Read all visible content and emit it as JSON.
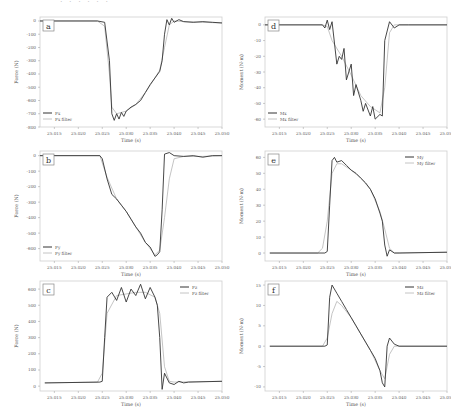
{
  "chart_data": [
    {
      "id": "a",
      "type": "line",
      "label": "a",
      "xlabel": "Time (s)",
      "ylabel": "Force (N)",
      "xticks": [
        "25.015",
        "25.020",
        "25.025",
        "25.030",
        "25.035",
        "25.040",
        "25.045",
        "25.050"
      ],
      "xlim": [
        25.012,
        25.05
      ],
      "yticks": [
        0,
        -100,
        -200,
        -300,
        -400,
        -500,
        -600,
        -700,
        -800
      ],
      "ylim": [
        -800,
        30
      ],
      "legend_pos": "lower-left",
      "series": [
        {
          "name": "Fx",
          "x": [
            25.012,
            25.024,
            25.0255,
            25.0265,
            25.027,
            25.0275,
            25.028,
            25.0285,
            25.029,
            25.0295,
            25.03,
            25.031,
            25.032,
            25.033,
            25.034,
            25.035,
            25.036,
            25.037,
            25.0375,
            25.038,
            25.0385,
            25.039,
            25.0395,
            25.04,
            25.041,
            25.042,
            25.044,
            25.046,
            25.048,
            25.05
          ],
          "values": [
            0,
            0,
            -10,
            -300,
            -700,
            -750,
            -700,
            -740,
            -690,
            -720,
            -680,
            -650,
            -630,
            -600,
            -540,
            -480,
            -430,
            -380,
            -300,
            -100,
            10,
            -30,
            20,
            -10,
            10,
            -5,
            -10,
            -5,
            -10,
            -15
          ]
        },
        {
          "name": "Fx filter",
          "x": [
            25.012,
            25.024,
            25.0255,
            25.0265,
            25.027,
            25.028,
            25.03,
            25.032,
            25.034,
            25.036,
            25.037,
            25.038,
            25.039,
            25.04,
            25.042,
            25.046,
            25.05
          ],
          "values": [
            0,
            0,
            -40,
            -400,
            -650,
            -700,
            -680,
            -630,
            -540,
            -430,
            -370,
            -200,
            -30,
            0,
            -5,
            -10,
            -15
          ]
        }
      ]
    },
    {
      "id": "b",
      "type": "line",
      "label": "b",
      "xlabel": "Time (s)",
      "ylabel": "Force (N)",
      "xticks": [
        "25.015",
        "25.020",
        "25.025",
        "25.030",
        "25.035",
        "25.040",
        "25.045",
        "25.050"
      ],
      "xlim": [
        25.012,
        25.05
      ],
      "yticks": [
        0,
        -100,
        -200,
        -300,
        -400,
        -500,
        -600
      ],
      "ylim": [
        -680,
        30
      ],
      "legend_pos": "lower-left",
      "series": [
        {
          "name": "Fy",
          "x": [
            25.012,
            25.0245,
            25.025,
            25.026,
            25.027,
            25.028,
            25.029,
            25.03,
            25.031,
            25.032,
            25.033,
            25.034,
            25.035,
            25.036,
            25.0365,
            25.037,
            25.0375,
            25.038,
            25.039,
            25.04,
            25.042,
            25.044,
            25.046,
            25.048,
            25.05
          ],
          "values": [
            0,
            0,
            -20,
            -150,
            -250,
            -280,
            -320,
            -360,
            -410,
            -460,
            -500,
            -560,
            -590,
            -650,
            -640,
            -620,
            -350,
            10,
            20,
            0,
            -5,
            0,
            -10,
            0,
            0
          ]
        },
        {
          "name": "Fy filter",
          "x": [
            25.012,
            25.0245,
            25.026,
            25.028,
            25.03,
            25.032,
            25.034,
            25.036,
            25.037,
            25.038,
            25.039,
            25.04,
            25.042,
            25.046,
            25.05
          ],
          "values": [
            0,
            0,
            -140,
            -280,
            -360,
            -460,
            -560,
            -640,
            -610,
            -400,
            -150,
            -20,
            -5,
            -5,
            0
          ]
        }
      ]
    },
    {
      "id": "c",
      "type": "line",
      "label": "c",
      "xlabel": "Time (s)",
      "ylabel": "Force (N)",
      "xticks": [
        "25.015",
        "25.020",
        "25.025",
        "25.030",
        "25.035",
        "25.040",
        "25.045",
        "25.050"
      ],
      "xlim": [
        25.012,
        25.05
      ],
      "yticks": [
        0,
        100,
        200,
        300,
        400,
        500,
        600
      ],
      "ylim": [
        -30,
        650
      ],
      "legend_pos": "upper-right",
      "series": [
        {
          "name": "Fz",
          "x": [
            25.013,
            25.0245,
            25.025,
            25.0255,
            25.026,
            25.027,
            25.028,
            25.029,
            25.03,
            25.031,
            25.032,
            25.033,
            25.034,
            25.035,
            25.036,
            25.0365,
            25.037,
            25.0375,
            25.038,
            25.039,
            25.04,
            25.041,
            25.042,
            25.043,
            25.05
          ],
          "values": [
            20,
            25,
            30,
            300,
            550,
            580,
            530,
            610,
            520,
            600,
            560,
            630,
            540,
            610,
            550,
            500,
            300,
            -20,
            80,
            20,
            10,
            30,
            20,
            25,
            30
          ]
        },
        {
          "name": "Fz filter",
          "x": [
            25.013,
            25.024,
            25.025,
            25.026,
            25.028,
            25.03,
            25.032,
            25.034,
            25.036,
            25.037,
            25.038,
            25.039,
            25.04,
            25.05
          ],
          "values": [
            20,
            25,
            80,
            450,
            560,
            570,
            580,
            580,
            550,
            450,
            120,
            30,
            25,
            30
          ]
        }
      ]
    },
    {
      "id": "d",
      "type": "line",
      "label": "d",
      "xlabel": "Time (s)",
      "ylabel": "Moment (N·m)",
      "xticks": [
        "25.015",
        "25.020",
        "25.025",
        "25.030",
        "25.035",
        "25.040",
        "25.045",
        "25.050"
      ],
      "xlim": [
        25.012,
        25.05
      ],
      "yticks": [
        0,
        -10,
        -20,
        -30,
        -40,
        -50,
        -60
      ],
      "ylim": [
        -65,
        5
      ],
      "legend_pos": "lower-left",
      "series": [
        {
          "name": "Mx",
          "x": [
            25.012,
            25.024,
            25.0245,
            25.025,
            25.0255,
            25.026,
            25.027,
            25.0275,
            25.028,
            25.0285,
            25.029,
            25.03,
            25.0305,
            25.031,
            25.032,
            25.0325,
            25.033,
            25.034,
            25.0345,
            25.035,
            25.036,
            25.0365,
            25.037,
            25.038,
            25.039,
            25.04,
            25.042,
            25.05
          ],
          "values": [
            0,
            0,
            -2,
            3,
            -3,
            2,
            -25,
            -20,
            -22,
            -15,
            -35,
            -25,
            -45,
            -38,
            -48,
            -55,
            -50,
            -58,
            -52,
            -60,
            -57,
            -58,
            -10,
            2,
            -2,
            0,
            0,
            0
          ]
        },
        {
          "name": "Mx filter",
          "x": [
            25.012,
            25.024,
            25.025,
            25.026,
            25.028,
            25.03,
            25.032,
            25.034,
            25.036,
            25.037,
            25.038,
            25.039,
            25.04,
            25.05
          ],
          "values": [
            0,
            0,
            -1,
            -10,
            -20,
            -32,
            -45,
            -52,
            -56,
            -40,
            -5,
            0,
            0,
            0
          ]
        }
      ]
    },
    {
      "id": "e",
      "type": "line",
      "label": "e",
      "xlabel": "Time (s)",
      "ylabel": "Moment (N·m)",
      "xticks": [
        "25.015",
        "25.020",
        "25.025",
        "25.030",
        "25.035",
        "25.040",
        "25.045",
        "25.050"
      ],
      "xlim": [
        25.012,
        25.05
      ],
      "yticks": [
        0,
        10,
        20,
        30,
        40,
        50,
        60
      ],
      "ylim": [
        -5,
        64
      ],
      "legend_pos": "upper-right",
      "series": [
        {
          "name": "My",
          "x": [
            25.013,
            25.0245,
            25.025,
            25.0255,
            25.026,
            25.0265,
            25.027,
            25.028,
            25.029,
            25.03,
            25.031,
            25.032,
            25.033,
            25.034,
            25.035,
            25.036,
            25.0365,
            25.037,
            25.0375,
            25.038,
            25.039,
            25.04,
            25.05
          ],
          "values": [
            0,
            0,
            1,
            30,
            58,
            60,
            57,
            58,
            55,
            52,
            50,
            47,
            44,
            40,
            34,
            25,
            20,
            5,
            -2,
            2,
            0,
            0,
            0.5
          ]
        },
        {
          "name": "My filter",
          "x": [
            25.013,
            25.023,
            25.024,
            25.025,
            25.026,
            25.027,
            25.028,
            25.03,
            25.032,
            25.034,
            25.036,
            25.037,
            25.038,
            25.039,
            25.05
          ],
          "values": [
            0,
            0,
            3,
            20,
            50,
            56,
            56,
            52,
            47,
            40,
            26,
            15,
            3,
            0,
            0.5
          ]
        }
      ]
    },
    {
      "id": "f",
      "type": "line",
      "label": "f",
      "xlabel": "Time (s)",
      "ylabel": "Moment (N·m)",
      "xticks": [
        "25.015",
        "25.020",
        "25.025",
        "25.030",
        "25.035",
        "25.040",
        "25.045",
        "25.050"
      ],
      "xlim": [
        25.012,
        25.05
      ],
      "yticks": [
        15,
        10,
        5,
        0,
        -5,
        -10
      ],
      "ylim": [
        -11,
        16
      ],
      "legend_pos": "upper-right",
      "series": [
        {
          "name": "Mz",
          "x": [
            25.013,
            25.0245,
            25.025,
            25.0255,
            25.026,
            25.027,
            25.028,
            25.029,
            25.03,
            25.031,
            25.032,
            25.033,
            25.034,
            25.035,
            25.036,
            25.0365,
            25.037,
            25.0375,
            25.038,
            25.039,
            25.04,
            25.05
          ],
          "values": [
            0,
            0,
            0.3,
            12,
            15,
            13,
            11,
            9,
            7,
            5,
            3,
            1,
            -1,
            -3,
            -6,
            -9,
            -10,
            0,
            2,
            0.5,
            0,
            0
          ]
        },
        {
          "name": "Mz filter",
          "x": [
            25.013,
            25.024,
            25.025,
            25.026,
            25.027,
            25.028,
            25.03,
            25.032,
            25.034,
            25.036,
            25.037,
            25.038,
            25.039,
            25.05
          ],
          "values": [
            0,
            0,
            2,
            8,
            11,
            10,
            7,
            3,
            -1,
            -6,
            -8,
            -2,
            0,
            0
          ]
        }
      ]
    }
  ],
  "top_strip_text": "· · · · · ·"
}
